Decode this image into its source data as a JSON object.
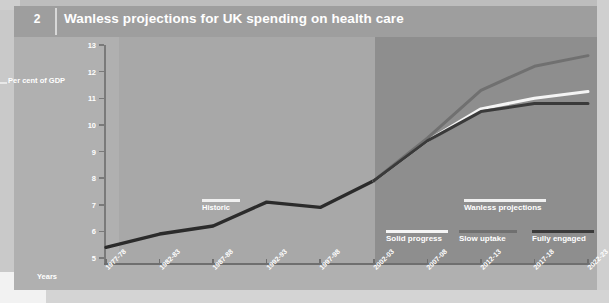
{
  "figure": {
    "number": "2",
    "title": "Wanless projections for UK spending on health care"
  },
  "annotations": {
    "historic": "Historic",
    "wanless_projections": "Wanless projections"
  },
  "legend": {
    "items": [
      {
        "label": "Solid progress",
        "color": "#f5f5f5"
      },
      {
        "label": "Slow uptake",
        "color": "#707070"
      },
      {
        "label": "Fully engaged",
        "color": "#3a3a3a"
      }
    ]
  },
  "chart_data": {
    "type": "line",
    "title": "Wanless projections for UK spending on health care",
    "xlabel": "Years",
    "ylabel": "Per cent of GDP",
    "ylim": [
      5,
      13
    ],
    "yticks": [
      5,
      6,
      7,
      8,
      9,
      10,
      11,
      12,
      13
    ],
    "grid": false,
    "legend_position": "bottom-right",
    "categories": [
      "1977-78",
      "1982-83",
      "1987-88",
      "1992-93",
      "1997-98",
      "2002-03",
      "2007-08",
      "2012-13",
      "2017-18",
      "2022-23"
    ],
    "projection_starts_at": "2002-03",
    "series": [
      {
        "name": "Historic",
        "color": "#2b2b2b",
        "x": [
          "1977-78",
          "1982-83",
          "1987-88",
          "1992-93",
          "1997-98",
          "2002-03"
        ],
        "values": [
          5.4,
          5.9,
          6.2,
          7.1,
          6.9,
          7.9
        ]
      },
      {
        "name": "Solid progress",
        "color": "#f5f5f5",
        "x": [
          "2002-03",
          "2007-08",
          "2012-13",
          "2017-18",
          "2022-23"
        ],
        "values": [
          7.9,
          9.4,
          10.6,
          11.0,
          11.25
        ]
      },
      {
        "name": "Slow uptake",
        "color": "#707070",
        "x": [
          "2002-03",
          "2007-08",
          "2012-13",
          "2017-18",
          "2022-23"
        ],
        "values": [
          7.9,
          9.5,
          11.3,
          12.2,
          12.6
        ]
      },
      {
        "name": "Fully engaged",
        "color": "#3a3a3a",
        "x": [
          "2002-03",
          "2007-08",
          "2012-13",
          "2017-18",
          "2022-23"
        ],
        "values": [
          7.9,
          9.4,
          10.5,
          10.8,
          10.8
        ]
      }
    ]
  }
}
